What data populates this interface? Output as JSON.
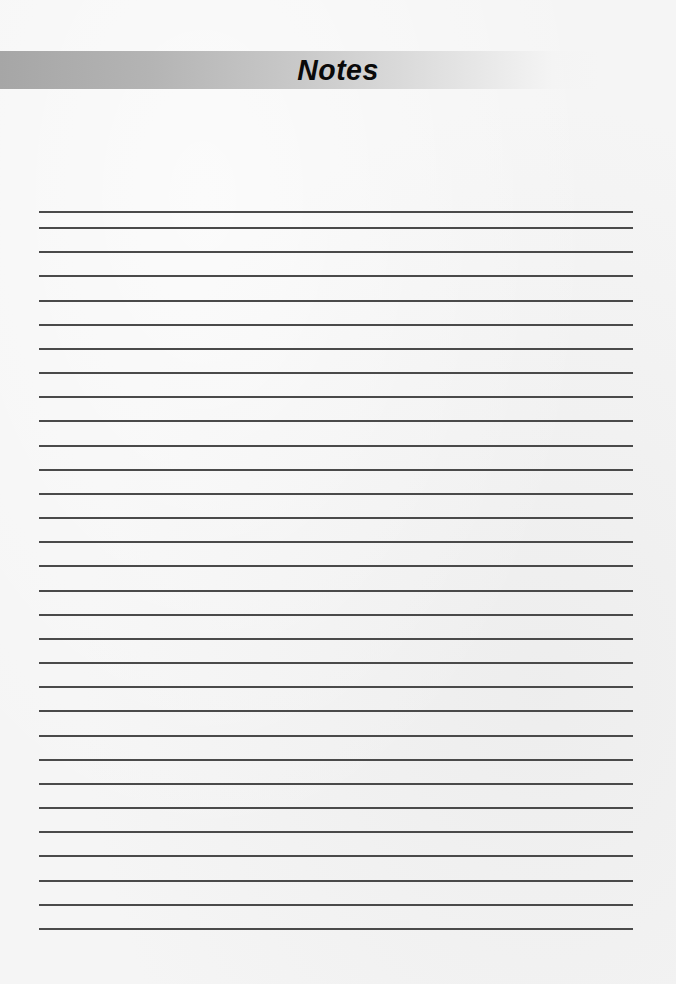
{
  "header": {
    "title": "Notes"
  },
  "ruled_area": {
    "line_count": 31,
    "first_line_y": 211,
    "second_line_y": 227,
    "line_spacing": 24.17,
    "left_x": 39,
    "right_x": 633
  },
  "colors": {
    "header_bar_start": "#a6a6a6",
    "header_bar_end": "#f4f4f4",
    "title_text": "#0a0a0a",
    "rule_line": "#4a4a4a",
    "page_background": "#f5f5f5"
  }
}
